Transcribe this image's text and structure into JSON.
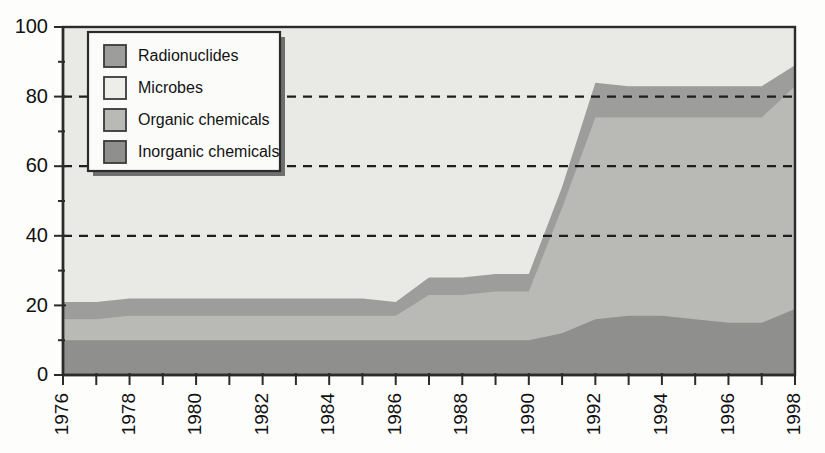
{
  "chart_data": {
    "type": "area",
    "stacked": true,
    "title": "",
    "subtitle": "",
    "xlabel": "",
    "ylabel": "",
    "xlim": [
      1976,
      1998
    ],
    "ylim": [
      0,
      100
    ],
    "grid": "horizontal-dashed",
    "gridlines": [
      40,
      60,
      80
    ],
    "legend_position": "top-left-inside",
    "x": [
      1976,
      1977,
      1978,
      1979,
      1980,
      1981,
      1982,
      1983,
      1984,
      1985,
      1986,
      1987,
      1988,
      1989,
      1990,
      1991,
      1992,
      1993,
      1994,
      1995,
      1996,
      1997,
      1998
    ],
    "xticks": [
      1976,
      1978,
      1980,
      1982,
      1984,
      1986,
      1988,
      1990,
      1992,
      1994,
      1996,
      1998
    ],
    "xtick_labels": [
      "1976",
      "1978",
      "1980",
      "1982",
      "1984",
      "1986",
      "1988",
      "1990",
      "1992",
      "1994",
      "1996",
      "1998"
    ],
    "yticks": [
      0,
      20,
      40,
      60,
      80,
      100
    ],
    "ytick_labels": [
      "0",
      "20",
      "40",
      "60",
      "80",
      "100"
    ],
    "stack_order_bottom_to_top": [
      "Inorganic chemicals",
      "Organic chemicals",
      "Radionuclides",
      "Microbes"
    ],
    "series": [
      {
        "name": "Inorganic chemicals",
        "color": "#8f8f8d",
        "values": [
          10,
          10,
          10,
          10,
          10,
          10,
          10,
          10,
          10,
          10,
          10,
          10,
          10,
          10,
          10,
          12,
          16,
          17,
          17,
          16,
          15,
          15,
          19
        ]
      },
      {
        "name": "Organic chemicals",
        "color": "#b9b9b6",
        "values": [
          6,
          6,
          7,
          7,
          7,
          7,
          7,
          7,
          7,
          7,
          7,
          13,
          13,
          14,
          14,
          36,
          58,
          57,
          57,
          58,
          59,
          59,
          64
        ]
      },
      {
        "name": "Radionuclides",
        "color": "#9d9d9b",
        "values": [
          5,
          5,
          5,
          5,
          5,
          5,
          5,
          5,
          5,
          5,
          4,
          5,
          5,
          5,
          5,
          6,
          10,
          9,
          9,
          9,
          9,
          9,
          6
        ]
      },
      {
        "name": "Microbes",
        "color": "#e9e9e6",
        "values": [
          79,
          79,
          78,
          78,
          78,
          78,
          78,
          78,
          78,
          78,
          79,
          67,
          67,
          66,
          66,
          46,
          16,
          17,
          17,
          17,
          17,
          17,
          11
        ]
      }
    ],
    "cumulative_tops": {
      "inorganic": [
        10,
        10,
        10,
        10,
        10,
        10,
        10,
        10,
        10,
        10,
        10,
        10,
        10,
        10,
        10,
        12,
        16,
        17,
        17,
        16,
        15,
        15,
        19
      ],
      "organic": [
        16,
        16,
        17,
        17,
        17,
        17,
        17,
        17,
        17,
        17,
        17,
        23,
        23,
        24,
        24,
        48,
        74,
        74,
        74,
        74,
        74,
        74,
        83
      ],
      "radionuclides": [
        21,
        21,
        22,
        22,
        22,
        22,
        22,
        22,
        22,
        22,
        21,
        28,
        28,
        29,
        29,
        54,
        84,
        83,
        83,
        83,
        83,
        83,
        89
      ],
      "microbes": [
        100,
        100,
        100,
        100,
        100,
        100,
        100,
        100,
        100,
        100,
        100,
        95,
        95,
        95,
        95,
        100,
        100,
        100,
        100,
        100,
        100,
        100,
        100
      ]
    }
  },
  "legend": {
    "items": [
      {
        "label": "Radionuclides",
        "color": "#9d9d9b"
      },
      {
        "label": "Microbes",
        "color": "#ededea"
      },
      {
        "label": "Organic chemicals",
        "color": "#b9b9b6"
      },
      {
        "label": "Inorganic chemicals",
        "color": "#8f8f8d"
      }
    ]
  },
  "axes": {
    "y_labels": [
      "100",
      "80",
      "60",
      "40",
      "20",
      "0"
    ],
    "x_labels": [
      "1976",
      "1978",
      "1980",
      "1982",
      "1984",
      "1986",
      "1988",
      "1990",
      "1992",
      "1994",
      "1996",
      "1998"
    ]
  },
  "colors": {
    "plot_background": "#e9e9e6",
    "axis": "#2b2b2b",
    "gridline": "#1e1e1e",
    "inorganic": "#8f8f8d",
    "organic": "#b9b9b6",
    "radionuclides": "#9d9d9b",
    "microbes": "#e9e9e6"
  }
}
